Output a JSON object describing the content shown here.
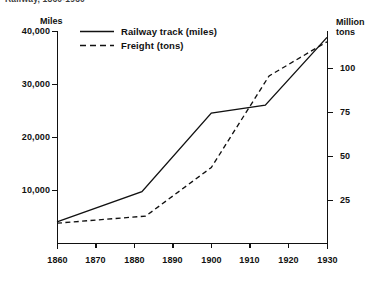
{
  "title_clipped": "Railway, 1860-1930",
  "axes": {
    "left_title": "Miles",
    "right_title_line1": "Million",
    "right_title_line2": "tons",
    "left_ticks": [
      "40,000",
      "30,000",
      "20,000",
      "10,000"
    ],
    "right_ticks": [
      "100",
      "75",
      "50",
      "25"
    ],
    "x_ticks": [
      "1860",
      "1870",
      "1880",
      "1890",
      "1900",
      "1910",
      "1920",
      "1930"
    ]
  },
  "legend": {
    "items": [
      {
        "label": "Railway track (miles)",
        "style": "solid",
        "icon": "solid-line-icon"
      },
      {
        "label": "Freight (tons)",
        "style": "dashed",
        "icon": "dashed-line-icon"
      }
    ]
  },
  "chart_data": {
    "type": "line",
    "title": "Railway, 1860-1930",
    "xlabel": "",
    "ylabel": "Miles",
    "y2label": "Million tons",
    "xlim": [
      1860,
      1930
    ],
    "ylim": [
      0,
      40000
    ],
    "y2lim": [
      0,
      118
    ],
    "grid": false,
    "legend_position": "top-left-inside",
    "x_ticks": [
      1860,
      1870,
      1880,
      1890,
      1900,
      1910,
      1920,
      1930
    ],
    "y_ticks": [
      10000,
      20000,
      30000,
      40000
    ],
    "y2_ticks": [
      25,
      50,
      75,
      100
    ],
    "series": [
      {
        "name": "Railway track (miles)",
        "axis": "left",
        "units": "miles",
        "style": "solid",
        "x": [
          1860,
          1882,
          1900,
          1914,
          1930
        ],
        "values": [
          4000,
          9700,
          24500,
          26000,
          38800
        ]
      },
      {
        "name": "Freight (tons)",
        "axis": "right",
        "units": "million tons",
        "style": "dashed",
        "x": [
          1860,
          1883,
          1900,
          1915,
          1930
        ],
        "values": [
          11,
          15,
          42,
          93,
          112
        ]
      }
    ]
  },
  "geometry": {
    "plot_left": 57,
    "plot_right": 327,
    "plot_bottom": 243,
    "plot_top": 31,
    "y_zero_px": 243,
    "y_40000_px": 31
  }
}
